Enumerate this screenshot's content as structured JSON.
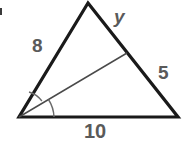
{
  "figure": {
    "kind": "geometry-diagram",
    "background_color": "#ffffff",
    "stroke_color": "#1a1a1a",
    "cevian_color": "#4a4a4a",
    "arc_color": "#6a6a6a",
    "label_color": "#5a5a5a",
    "labels": {
      "left_side": "8",
      "upper_right_side": "y",
      "lower_right_side": "5",
      "base": "10"
    },
    "vertices": {
      "apex": {
        "x": 88,
        "y": 3
      },
      "bottom_left": {
        "x": 19,
        "y": 117
      },
      "bottom_right": {
        "x": 178,
        "y": 117
      },
      "cevian_foot": {
        "x": 127,
        "y": 53
      }
    },
    "arcs": {
      "count": 2,
      "names": [
        "angle-arc-upper",
        "angle-arc-lower"
      ]
    }
  }
}
